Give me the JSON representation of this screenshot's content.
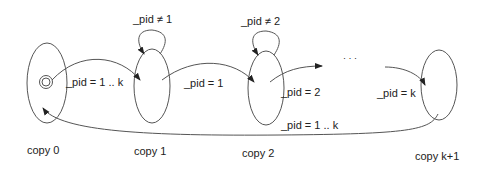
{
  "diagram": {
    "states": [
      {
        "id": "copy0",
        "label": "copy 0",
        "initial": true
      },
      {
        "id": "copy1",
        "label": "copy 1",
        "self_loop": "_pid ≠ 1"
      },
      {
        "id": "copy2",
        "label": "copy 2",
        "self_loop": "_pid ≠ 2"
      },
      {
        "id": "copyk1",
        "label": "copy k+1"
      }
    ],
    "transitions": [
      {
        "from": "copy0",
        "to": "copy1",
        "label": "_pid = 1 .. k"
      },
      {
        "from": "copy1",
        "to": "copy2",
        "label": "_pid = 1"
      },
      {
        "from": "copy2",
        "to": "ellipsis",
        "label": "_pid = 2"
      },
      {
        "from": "ellipsis",
        "to": "copyk1",
        "label": "_pid = k"
      },
      {
        "from": "copyk1",
        "to": "copy0",
        "label": "_pid = 1 .. k"
      }
    ],
    "ellipsis": "· · ·"
  },
  "colors": {
    "stroke": "#555555",
    "text": "#222222"
  }
}
